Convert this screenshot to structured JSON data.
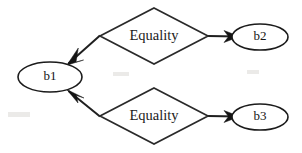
{
  "diagram": {
    "background_color": "#ffffff",
    "stroke_color": "#1b1b1b",
    "text_color": "#141414",
    "nodes": [
      {
        "id": "b1",
        "label": "b1",
        "shape": "ellipse",
        "cx": 50,
        "cy": 77,
        "rx": 32,
        "ry": 15
      },
      {
        "id": "b2",
        "label": "b2",
        "shape": "ellipse",
        "cx": 260,
        "cy": 37,
        "rx": 28,
        "ry": 13
      },
      {
        "id": "b3",
        "label": "b3",
        "shape": "ellipse",
        "cx": 260,
        "cy": 117,
        "rx": 28,
        "ry": 13
      }
    ],
    "relations": [
      {
        "id": "equality-top",
        "label": "Equality",
        "shape": "diamond",
        "cx": 154,
        "cy": 36,
        "half_width": 54,
        "half_height": 28
      },
      {
        "id": "equality-bottom",
        "label": "Equality",
        "shape": "diamond",
        "cx": 154,
        "cy": 116,
        "half_width": 54,
        "half_height": 28
      }
    ],
    "edges": [
      {
        "id": "edge-equality-top-to-b2",
        "from": "equality-top",
        "to": "b2",
        "direction": "right",
        "arrow": true
      },
      {
        "id": "edge-equality-top-to-b1",
        "from": "equality-top",
        "to": "b1",
        "direction": "down-left",
        "arrow": true
      },
      {
        "id": "edge-equality-bottom-to-b3",
        "from": "equality-bottom",
        "to": "b3",
        "direction": "right",
        "arrow": true
      },
      {
        "id": "edge-equality-bottom-to-b1",
        "from": "equality-bottom",
        "to": "b1",
        "direction": "up-left",
        "arrow": true
      }
    ]
  }
}
